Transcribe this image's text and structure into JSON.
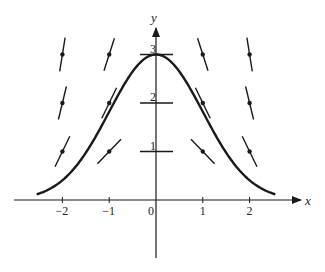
{
  "figure": {
    "type": "slope-field",
    "axes": {
      "x_label": "x",
      "y_label": "y",
      "x_ticks": [
        {
          "value": -2,
          "label": "−2"
        },
        {
          "value": -1,
          "label": "−1"
        },
        {
          "value": 0,
          "label": "0"
        },
        {
          "value": 1,
          "label": "1"
        },
        {
          "value": 2,
          "label": "2"
        }
      ],
      "y_ticks": [
        {
          "value": 1,
          "label": "1"
        },
        {
          "value": 2,
          "label": "2"
        },
        {
          "value": 3,
          "label": "3"
        }
      ],
      "x_range": [
        -3.0,
        3.1
      ],
      "y_range": [
        -1.2,
        3.6
      ]
    },
    "slope_field": {
      "points_x": [
        -2,
        -1,
        0,
        1,
        2
      ],
      "points_y": [
        1,
        2,
        3
      ],
      "note": "slope at each point equals -x*y"
    },
    "solution_curve": {
      "description": "y = 3e^(-x^2/2)",
      "x_start": -2.55,
      "x_end": 2.55,
      "peak": {
        "x": 0,
        "y": 3
      }
    },
    "colors": {
      "stroke": "#1a1a1a",
      "background": "#ffffff"
    }
  }
}
